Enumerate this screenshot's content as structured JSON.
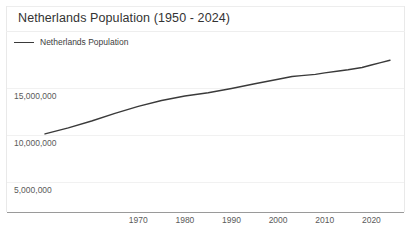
{
  "chart": {
    "title": "Netherlands Population (1950 - 2024)",
    "legend": [
      {
        "label": "Netherlands Population",
        "color": "#3a3a3a",
        "icon": "line-swatch-icon"
      }
    ],
    "y_axis": {
      "tick_labels": [
        "15,000,000",
        "10,000,000",
        "5,000,000"
      ]
    },
    "x_axis": {
      "tick_labels": [
        "1970",
        "1980",
        "1990",
        "2000",
        "2010",
        "2020"
      ]
    }
  },
  "chart_data": {
    "type": "line",
    "title": "Netherlands Population (1950 - 2024)",
    "xlabel": "",
    "ylabel": "",
    "xlim": [
      1950,
      2024
    ],
    "ylim": [
      2100000,
      17900000
    ],
    "grid": true,
    "legend_position": "top-left",
    "xticks": [
      1970,
      1980,
      1990,
      2000,
      2010,
      2020
    ],
    "xtick_labels": [
      "1970",
      "1980",
      "1990",
      "2000",
      "2010",
      "2020"
    ],
    "yticks": [
      5000000,
      10000000,
      15000000
    ],
    "ytick_labels": [
      "5,000,000",
      "10,000,000",
      "15,000,000"
    ],
    "series": [
      {
        "name": "Netherlands Population",
        "color": "#3a3a3a",
        "x": [
          1950,
          1955,
          1960,
          1965,
          1970,
          1975,
          1980,
          1985,
          1990,
          1995,
          2000,
          2003,
          2005,
          2008,
          2010,
          2013,
          2015,
          2018,
          2020,
          2022,
          2024
        ],
        "values": [
          10114000,
          10751000,
          11487000,
          12295000,
          13039000,
          13666000,
          14150000,
          14492000,
          14952000,
          15459000,
          15926000,
          16225000,
          16320000,
          16446000,
          16615000,
          16805000,
          16939000,
          17180000,
          17441000,
          17703000,
          17950000
        ]
      }
    ]
  }
}
